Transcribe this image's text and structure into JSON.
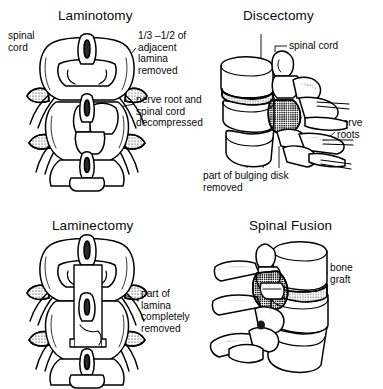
{
  "figure": {
    "type": "medical-illustration",
    "background_color": "#ffffff",
    "ink_color": "#000000"
  },
  "panels": [
    {
      "id": "laminotomy",
      "title": "Laminotomy",
      "view": "posterior",
      "labels": [
        {
          "id": "spinal-cord",
          "text": "spinal\ncord"
        },
        {
          "id": "lamina-removed",
          "text": "1/3 –1/2 of\nadjacent\nlamina\nremoved"
        },
        {
          "id": "decompressed",
          "text": "nerve root and\nspinal cord\ndecompressed"
        }
      ]
    },
    {
      "id": "discectomy",
      "title": "Discectomy",
      "view": "lateral",
      "labels": [
        {
          "id": "spinal-cord",
          "text": "spinal cord"
        },
        {
          "id": "nerve-roots",
          "text": "nerve\nroots"
        },
        {
          "id": "bulging-disk",
          "text": "part of bulging disk\nremoved"
        }
      ]
    },
    {
      "id": "laminectomy",
      "title": "Laminectomy",
      "view": "posterior",
      "labels": [
        {
          "id": "lamina-removed",
          "text": "part of\nlamina\ncompletely\nremoved"
        }
      ]
    },
    {
      "id": "spinal-fusion",
      "title": "Spinal Fusion",
      "view": "lateral",
      "labels": [
        {
          "id": "bone-graft",
          "text": "bone\ngraft"
        }
      ]
    }
  ]
}
